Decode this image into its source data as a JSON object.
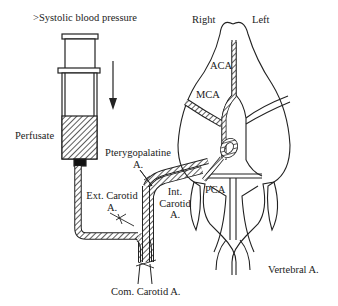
{
  "diagram": {
    "labels": {
      "pressure": ">Systolic blood pressure",
      "perfusate": "Perfusate",
      "pterygopalatine": "Pterygopalatine\nA.",
      "pterygopalatine_line1": "Pterygopalatine",
      "pterygopalatine_line2": "A.",
      "ext_carotid_line1": "Ext. Carotid",
      "ext_carotid_line2": "A.",
      "int_carotid_line1": "Int.",
      "int_carotid_line2": "Carotid",
      "int_carotid_line3": "A.",
      "com_carotid": "Com. Carotid A.",
      "right": "Right",
      "left": "Left",
      "aca": "ACA",
      "mca": "MCA",
      "pca": "PCA",
      "vertebral": "Vertebral A."
    },
    "colors": {
      "stroke": "#222222",
      "background": "#ffffff",
      "hatch": "#333333"
    }
  }
}
